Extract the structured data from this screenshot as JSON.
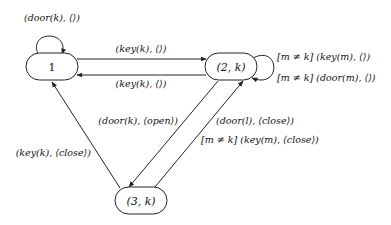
{
  "diagram": {
    "type": "state-machine",
    "nodes": [
      {
        "id": "n1",
        "label": "1"
      },
      {
        "id": "n2",
        "label": "(2, k)"
      },
      {
        "id": "n3",
        "label": "(3, k)"
      }
    ],
    "edges": [
      {
        "id": "e_loop1",
        "from": "n1",
        "to": "n1",
        "label": "(door(k), ⟨⟩)"
      },
      {
        "id": "e_1_2",
        "from": "n1",
        "to": "n2",
        "label": "(key(k), ⟨⟩)"
      },
      {
        "id": "e_2_1",
        "from": "n2",
        "to": "n1",
        "label": "(key(k), ⟨⟩)"
      },
      {
        "id": "e_loop2",
        "from": "n2",
        "to": "n2",
        "label_lines": [
          "[m ≠ k] (key(m), ⟨⟩)",
          "[m ≠ k] (door(m), ⟨⟩)"
        ]
      },
      {
        "id": "e_2_3",
        "from": "n2",
        "to": "n3",
        "label": "(door(k), ⟨open⟩)"
      },
      {
        "id": "e_3_2",
        "from": "n3",
        "to": "n2",
        "label_lines": [
          "(door(l), ⟨close⟩)",
          "[m ≠ k] (key(m), ⟨close⟩)"
        ]
      },
      {
        "id": "e_3_1",
        "from": "n3",
        "to": "n1",
        "label": "(key(k), ⟨close⟩)"
      }
    ]
  }
}
